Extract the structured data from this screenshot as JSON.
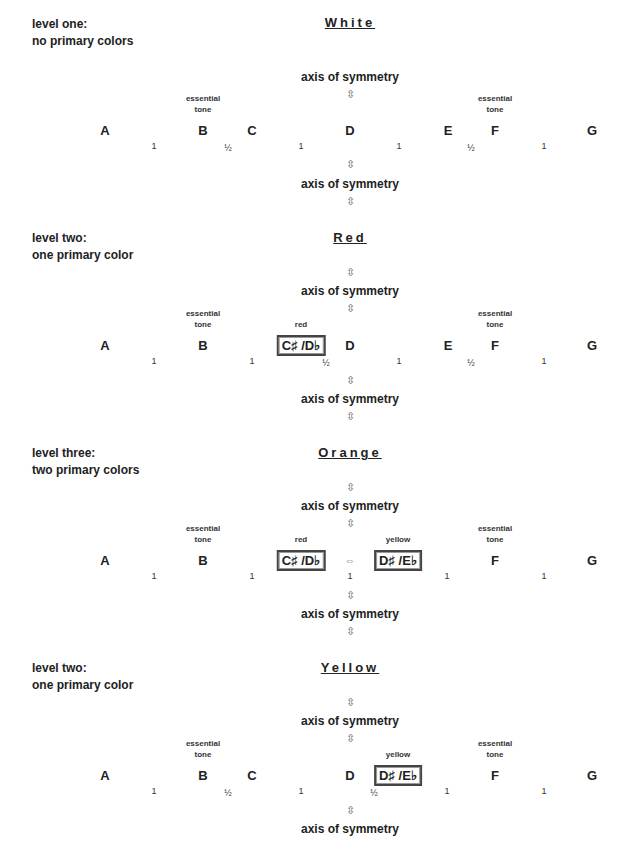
{
  "sections": [
    {
      "level": [
        "level one:",
        "no primary colors"
      ],
      "title": "White",
      "axis_top": "axis of symmetry",
      "axis_bottom": "axis of symmetry",
      "essential_label": [
        "essential",
        "tone"
      ],
      "notes": {
        "A": "A",
        "B": "B",
        "C": "C",
        "D": "D",
        "E": "E",
        "F": "F",
        "G": "G"
      },
      "intervals": [
        "1",
        "½",
        "1",
        "1",
        "½",
        "1"
      ]
    },
    {
      "level": [
        "level two:",
        "one primary color"
      ],
      "title": "Red",
      "axis_top": "axis of symmetry",
      "axis_bottom": "axis of symmetry",
      "essential_label": [
        "essential",
        "tone"
      ],
      "color_label": "red",
      "notes": {
        "A": "A",
        "B": "B",
        "Cs": "C♯ /D♭",
        "D": "D",
        "E": "E",
        "F": "F",
        "G": "G"
      },
      "intervals": [
        "1",
        "1",
        "½",
        "1",
        "½",
        "1"
      ]
    },
    {
      "level": [
        "level three:",
        "two primary colors"
      ],
      "title": "Orange",
      "axis_top": "axis of symmetry",
      "axis_bottom": "axis of symmetry",
      "essential_label": [
        "essential",
        "tone"
      ],
      "color_label_left": "red",
      "color_label_right": "yellow",
      "notes": {
        "A": "A",
        "B": "B",
        "Cs": "C♯ /D♭",
        "Ds": "D♯ /E♭",
        "F": "F",
        "G": "G"
      },
      "intervals": [
        "1",
        "1",
        "1",
        "1",
        "1"
      ]
    },
    {
      "level": [
        "level two:",
        "one primary color"
      ],
      "title": "Yellow",
      "axis_top": "axis of symmetry",
      "axis_bottom": "axis of symmetry",
      "essential_label": [
        "essential",
        "tone"
      ],
      "color_label": "yellow",
      "notes": {
        "A": "A",
        "B": "B",
        "C": "C",
        "D": "D",
        "Ds": "D♯ /E♭",
        "F": "F",
        "G": "G"
      },
      "intervals": [
        "1",
        "½",
        "1",
        "½",
        "1",
        "1"
      ]
    }
  ],
  "icons": {
    "vertical_arrow": "⇳",
    "horizontal_arrow": "⇔"
  }
}
